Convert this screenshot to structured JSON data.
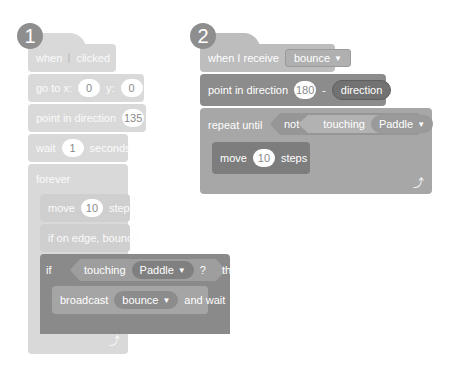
{
  "script1": {
    "badge": "1",
    "hat": {
      "before": "when",
      "icon": "green-flag-icon",
      "after": "clicked"
    },
    "goto": {
      "label": "go to x:",
      "x": "0",
      "ylabel": "y:",
      "y": "0"
    },
    "point": {
      "label": "point in direction",
      "value": "135"
    },
    "wait": {
      "label": "wait",
      "value": "1",
      "after": "seconds"
    },
    "forever": {
      "label": "forever"
    },
    "move": {
      "label": "move",
      "value": "10",
      "after": "steps"
    },
    "edge": {
      "label": "if on edge, bounce"
    },
    "if": {
      "label": "if",
      "touching": "touching",
      "target": "Paddle",
      "q": "?",
      "then": "then"
    },
    "broadcast": {
      "label": "broadcast",
      "msg": "bounce",
      "after": "and wait"
    }
  },
  "script2": {
    "badge": "2",
    "hat": {
      "label": "when I receive",
      "msg": "bounce"
    },
    "point": {
      "label": "point in direction",
      "value": "180",
      "op": "-",
      "reporter": "direction"
    },
    "repeat": {
      "label": "repeat until",
      "not": "not",
      "touching": "touching",
      "target": "Paddle",
      "q": "?"
    },
    "move": {
      "label": "move",
      "value": "10",
      "after": "steps"
    }
  }
}
